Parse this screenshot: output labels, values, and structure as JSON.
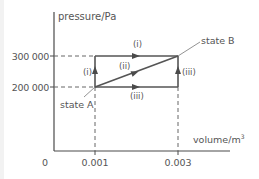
{
  "diagram": {
    "y_axis_label": "pressure/Pa",
    "x_axis_label": "volume/m",
    "x_axis_label_superscript": "3",
    "y_ticks": [
      {
        "label": "300 000",
        "value": 300000
      },
      {
        "label": "200 000",
        "value": 200000
      }
    ],
    "x_ticks": [
      {
        "label": "0",
        "value": 0
      },
      {
        "label": "0.001",
        "value": 0.001
      },
      {
        "label": "0.003",
        "value": 0.003
      }
    ],
    "states": {
      "a": {
        "label": "state A",
        "volume": 0.001,
        "pressure": 200000
      },
      "b": {
        "label": "state B",
        "volume": 0.003,
        "pressure": 300000
      }
    },
    "paths": {
      "i_vertical": "(i)",
      "i_horizontal": "(i)",
      "ii_diagonal": "(ii)",
      "iii_horizontal": "(iii)",
      "iii_vertical": "(iii)"
    },
    "colors": {
      "line": "#555555",
      "text": "#555555",
      "dashed": "#666666"
    }
  }
}
